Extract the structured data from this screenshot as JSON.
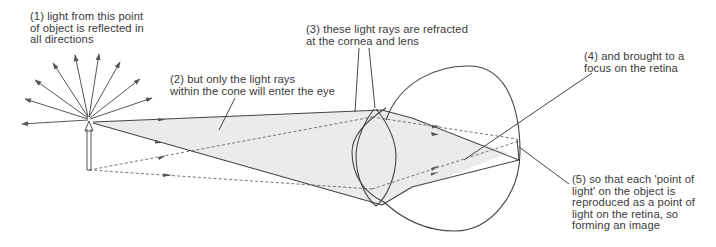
{
  "diagram": {
    "labels": [
      {
        "id": "step1",
        "text": "(1) light from this point\nof object is reflected in\nall directions",
        "x": 30,
        "y": 11
      },
      {
        "id": "step2",
        "text": "(2) but only the light rays\nwithin the cone will enter the eye",
        "x": 170,
        "y": 74
      },
      {
        "id": "step3",
        "text": "(3) these light rays are refracted\nat the cornea and lens",
        "x": 306,
        "y": 24
      },
      {
        "id": "step4",
        "text": "(4) and brought to a\nfocus on the retina",
        "x": 584,
        "y": 51
      },
      {
        "id": "step5",
        "text": "(5) so that each 'point of\nlight' on the object is\nreproduced as a point of\nlight on the retina, so\nforming an image",
        "x": 572,
        "y": 174
      }
    ],
    "elements": {
      "object_point": "light source point at top of object arrow",
      "object_arrow": "upright object arrow",
      "radiating_rays": "rays reflected in all directions",
      "light_cone": "shaded cone of rays entering eye",
      "cornea": "cornea curve",
      "lens": "biconvex lens",
      "eyeball": "eyeball circle",
      "retina_focus": "focus point on retina"
    },
    "colors": {
      "stroke": "#555555",
      "cone_fill": "#ebebeb",
      "text": "#3a3a3a",
      "background": "#ffffff"
    }
  }
}
